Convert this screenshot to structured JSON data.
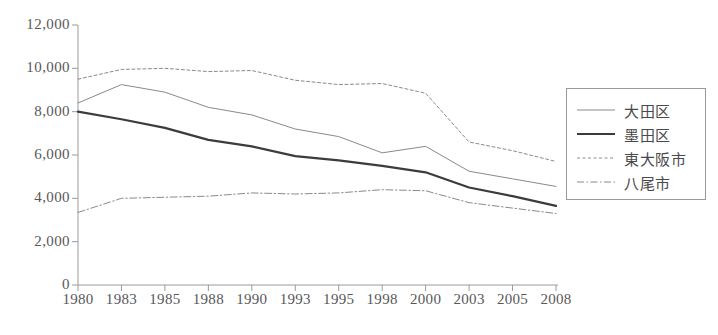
{
  "chart_data": {
    "type": "line",
    "title": "",
    "subtitle": "",
    "xlabel": "",
    "ylabel": "",
    "categories": [
      "1980",
      "1983",
      "1985",
      "1988",
      "1990",
      "1993",
      "1995",
      "1998",
      "2000",
      "2003",
      "2005",
      "2008"
    ],
    "xlim": [
      "1980",
      "2008"
    ],
    "ylim": [
      0,
      12000
    ],
    "ytick_values": [
      0,
      2000,
      4000,
      6000,
      8000,
      10000,
      12000
    ],
    "ytick_labels": [
      "0",
      "2,000",
      "4,000",
      "6,000",
      "8,000",
      "10,000",
      "12,000"
    ],
    "grid": false,
    "legend_position": "right",
    "series": [
      {
        "name": "大田区",
        "style": "solid-thin",
        "color": "#8a8a8c",
        "values": [
          8400,
          9250,
          8900,
          8200,
          7850,
          7200,
          6850,
          6100,
          6400,
          5250,
          4900,
          4550
        ]
      },
      {
        "name": "墨田区",
        "style": "solid-thick",
        "color": "#3c3c3e",
        "values": [
          8000,
          7650,
          7250,
          6700,
          6400,
          5950,
          5750,
          5500,
          5200,
          4500,
          4100,
          3650
        ]
      },
      {
        "name": "東大阪市",
        "style": "dotted",
        "color": "#8a8a8c",
        "values": [
          9500,
          9950,
          10000,
          9850,
          9900,
          9450,
          9250,
          9300,
          8850,
          6600,
          6200,
          5700
        ]
      },
      {
        "name": "八尾市",
        "style": "dash-dot",
        "color": "#8a8a8c",
        "values": [
          3350,
          4000,
          4050,
          4100,
          4250,
          4200,
          4250,
          4400,
          4350,
          3800,
          3550,
          3300
        ]
      }
    ]
  },
  "legend": {
    "entries": [
      {
        "label": "大田区"
      },
      {
        "label": "墨田区"
      },
      {
        "label": "東大阪市"
      },
      {
        "label": "八尾市"
      }
    ]
  },
  "axes": {
    "y_tick_labels": [
      "12,000",
      "10,000",
      "8,000",
      "6,000",
      "4,000",
      "2,000",
      "0"
    ],
    "x_tick_labels": [
      "1980",
      "1983",
      "1985",
      "1988",
      "1990",
      "1993",
      "1995",
      "1998",
      "2000",
      "2003",
      "2005",
      "2008"
    ]
  },
  "bottom_caption": ""
}
